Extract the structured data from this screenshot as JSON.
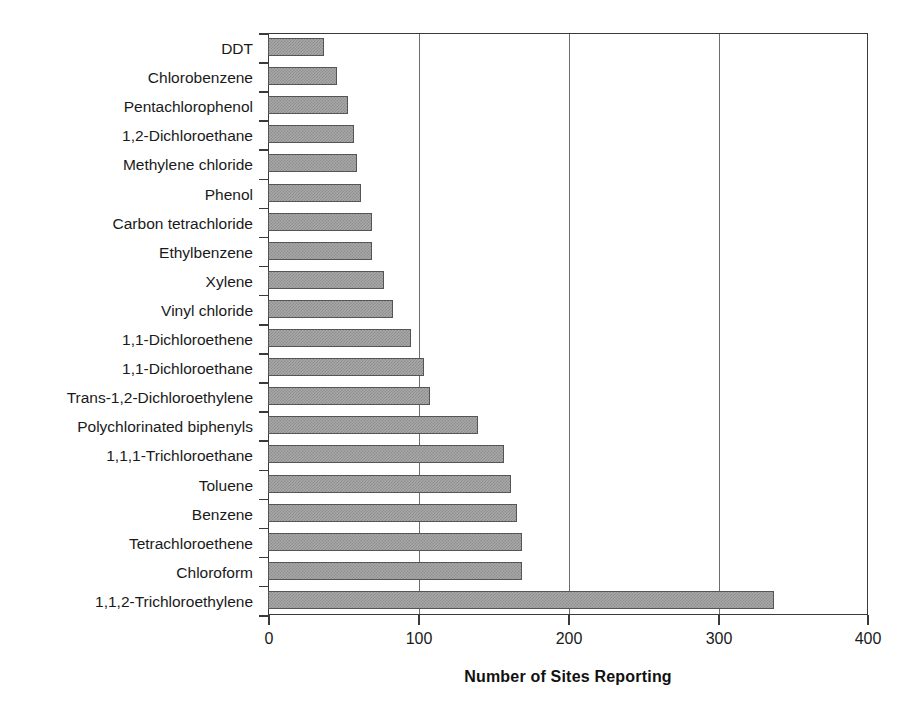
{
  "chart_data": {
    "type": "bar",
    "orientation": "horizontal",
    "title": "",
    "subtitle": "",
    "xlabel": "Number of Sites Reporting",
    "ylabel": "",
    "xlim": [
      0,
      400
    ],
    "xticks": [
      0,
      100,
      200,
      300,
      400
    ],
    "xtick_labels": [
      "0",
      "100",
      "200",
      "300",
      "400"
    ],
    "grid": "vertical-gridlines-at-100-200-300",
    "legend": "none",
    "categories": [
      "DDT",
      "Chlorobenzene",
      "Pentachlorophenol",
      "1,2-Dichloroethane",
      "Methylene chloride",
      "Phenol",
      "Carbon tetrachloride",
      "Ethylbenzene",
      "Xylene",
      "Vinyl chloride",
      "1,1-Dichloroethene",
      "1,1-Dichloroethane",
      "Trans-1,2-Dichloroethylene",
      "Polychlorinated biphenyls",
      "1,1,1-Trichloroethane",
      "Toluene",
      "Benzene",
      "Tetrachloroethene",
      "Chloroform",
      "1,1,2-Trichloroethylene"
    ],
    "values": [
      37,
      46,
      53,
      57,
      59,
      62,
      69,
      69,
      77,
      83,
      95,
      104,
      108,
      140,
      157,
      162,
      166,
      169,
      169,
      337
    ],
    "series": [
      {
        "name": "Number of Sites Reporting",
        "values": [
          37,
          46,
          53,
          57,
          59,
          62,
          69,
          69,
          77,
          83,
          95,
          104,
          108,
          140,
          157,
          162,
          166,
          169,
          169,
          337
        ]
      }
    ],
    "colors": {
      "bar_fill": "#a8a8a8",
      "bar_pattern": "#8d8d8d",
      "bar_border": "#555555",
      "axis": "#3a3a3a",
      "gridline": "#6d6d6d",
      "text": "#1a1a1a",
      "background": "#ffffff"
    }
  }
}
